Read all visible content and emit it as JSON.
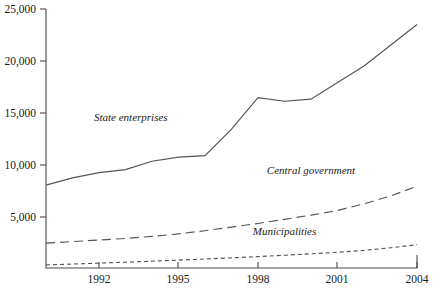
{
  "chart_data": {
    "type": "line",
    "title": "",
    "xlabel": "",
    "ylabel": "",
    "xlim": [
      1990,
      2004
    ],
    "ylim": [
      0,
      25000
    ],
    "grid": false,
    "legend": "inline-labels",
    "y_ticks": [
      0,
      5000,
      10000,
      15000,
      20000,
      25000
    ],
    "y_tick_labels": [
      "",
      "5,000",
      "10,000",
      "15,000",
      "20,000",
      "25,000"
    ],
    "x_ticks": [
      1992,
      1995,
      1998,
      2001,
      2004
    ],
    "x_tick_labels": [
      "1992",
      "1995",
      "1998",
      "2001",
      "2004"
    ],
    "x": [
      1990,
      1991,
      1992,
      1993,
      1994,
      1995,
      1996,
      1997,
      1998,
      1999,
      2000,
      2001,
      2002,
      2003,
      2004
    ],
    "series": [
      {
        "name": "State enterprises",
        "style": "solid",
        "label_x": 1993.2,
        "label_y": 14200,
        "values": [
          8000,
          8700,
          9200,
          9500,
          10300,
          10700,
          10850,
          13400,
          16450,
          16100,
          16300,
          17900,
          19500,
          21500,
          23500
        ]
      },
      {
        "name": "Central government",
        "style": "dashed",
        "label_x": 2000.0,
        "label_y": 9100,
        "values": [
          2400,
          2550,
          2700,
          2850,
          3050,
          3300,
          3600,
          3950,
          4300,
          4700,
          5100,
          5550,
          6200,
          6950,
          7900
        ]
      },
      {
        "name": "Municipalities",
        "style": "dotted",
        "label_x": 1999.0,
        "label_y": 3200,
        "values": [
          300,
          380,
          470,
          560,
          660,
          760,
          870,
          980,
          1100,
          1230,
          1370,
          1520,
          1700,
          1950,
          2250
        ]
      }
    ]
  },
  "labels": {
    "y_25000": "25,000",
    "y_20000": "20,000",
    "y_15000": "15,000",
    "y_10000": "10,000",
    "y_5000": "5,000",
    "x_1992": "1992",
    "x_1995": "1995",
    "x_1998": "1998",
    "x_2001": "2001",
    "x_2004": "2004",
    "series_state": "State enterprises",
    "series_central": "Central government",
    "series_municipal": "Municipalities"
  },
  "colors": {
    "line": "#555555",
    "axis": "#4a4a4a",
    "text": "#1a1a1a",
    "background": "#ffffff"
  }
}
